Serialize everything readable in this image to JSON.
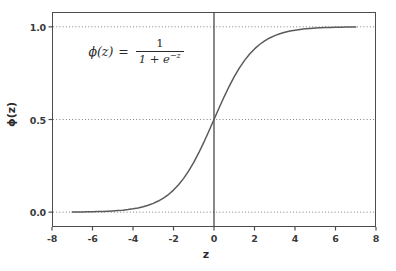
{
  "chart_data": {
    "type": "line",
    "title": "",
    "xlabel": "z",
    "ylabel": "ϕ(z)",
    "xlim": [
      -8,
      8
    ],
    "ylim": [
      -0.08,
      1.08
    ],
    "xticks": [
      "-8",
      "-6",
      "-4",
      "-2",
      "0",
      "2",
      "4",
      "6",
      "8"
    ],
    "xtick_values": [
      -8,
      -6,
      -4,
      -2,
      0,
      2,
      4,
      6,
      8
    ],
    "yticks": [
      "0.0",
      "0.5",
      "1.0"
    ],
    "ytick_values": [
      0.0,
      0.5,
      1.0
    ],
    "grid": "horizontal-dotted",
    "legend": "none",
    "annotations": [
      {
        "name": "sigmoid-formula",
        "lhs": "ϕ(z)",
        "equals": "=",
        "numerator": "1",
        "denominator_base": "1 + e",
        "denominator_exponent": "−z",
        "plain": "ϕ(z) = 1 / (1 + e^−z)",
        "x": -6.2,
        "y": 0.87
      }
    ],
    "vertical_line_x": 0,
    "series": [
      {
        "name": "sigmoid",
        "color": "#5a5a5a",
        "linewidth": 1.5,
        "x": [
          -7.0,
          -6.75,
          -6.5,
          -6.25,
          -6.0,
          -5.75,
          -5.5,
          -5.25,
          -5.0,
          -4.75,
          -4.5,
          -4.25,
          -4.0,
          -3.75,
          -3.5,
          -3.25,
          -3.0,
          -2.75,
          -2.5,
          -2.25,
          -2.0,
          -1.75,
          -1.5,
          -1.25,
          -1.0,
          -0.75,
          -0.5,
          -0.25,
          0.0,
          0.25,
          0.5,
          0.75,
          1.0,
          1.25,
          1.5,
          1.75,
          2.0,
          2.25,
          2.5,
          2.75,
          3.0,
          3.25,
          3.5,
          3.75,
          4.0,
          4.25,
          4.5,
          4.75,
          5.0,
          5.25,
          5.5,
          5.75,
          6.0,
          6.25,
          6.5,
          6.75,
          7.0
        ],
        "y": [
          0.0009,
          0.0012,
          0.0015,
          0.0019,
          0.0025,
          0.0032,
          0.0041,
          0.0052,
          0.0067,
          0.0086,
          0.011,
          0.0141,
          0.018,
          0.023,
          0.0293,
          0.0373,
          0.0474,
          0.0601,
          0.0759,
          0.0952,
          0.1192,
          0.148,
          0.1824,
          0.2227,
          0.2689,
          0.3208,
          0.3775,
          0.4378,
          0.5,
          0.5622,
          0.6225,
          0.6792,
          0.7311,
          0.7773,
          0.8176,
          0.852,
          0.8808,
          0.9046,
          0.9241,
          0.9399,
          0.9526,
          0.9627,
          0.9707,
          0.977,
          0.982,
          0.9859,
          0.989,
          0.9914,
          0.9933,
          0.9948,
          0.9959,
          0.9968,
          0.9975,
          0.9981,
          0.9985,
          0.9988,
          0.9991
        ]
      }
    ]
  },
  "style": {
    "background": "#ffffff",
    "frame_color": "#4c4c4c",
    "grid_color": "#808080",
    "curve_color": "#5a5a5a",
    "text_color": "#2b2b2b",
    "vline_color": "#3a3a3a"
  }
}
